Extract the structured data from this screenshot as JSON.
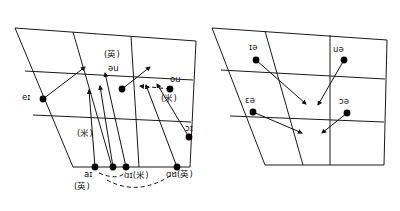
{
  "figure": {
    "type": "vowel-quadrilateral-diagram",
    "panel_count": 2,
    "stroke_color": "#1a1a1a",
    "dot_color": "#000000",
    "background": "#ffffff"
  },
  "panels": [
    {
      "id": "left-panel",
      "name": "closing-diphthongs-quadrilateral",
      "labels": [
        {
          "id": "l-ei",
          "text": "eɪ",
          "x": 22,
          "y": 93
        },
        {
          "id": "l-ying-top",
          "text": "(英)",
          "x": 104,
          "y": 54
        },
        {
          "id": "l-schwau",
          "text": "əu",
          "x": 108,
          "y": 69
        },
        {
          "id": "l-ou",
          "text": "ou",
          "x": 170,
          "y": 80
        },
        {
          "id": "l-mi-right",
          "text": "(米)",
          "x": 163,
          "y": 97
        },
        {
          "id": "l-mi-mid",
          "text": "(米)",
          "x": 79,
          "y": 132
        },
        {
          "id": "l-oi",
          "text": "ɔɪ",
          "x": 185,
          "y": 127
        },
        {
          "id": "l-ai-ying",
          "text": "aɪ",
          "x": 84,
          "y": 172
        },
        {
          "id": "l-ying-bot",
          "text": "(英)",
          "x": 76,
          "y": 185
        },
        {
          "id": "l-ai-mi",
          "text": "ɑɪ(米)",
          "x": 124,
          "y": 174
        },
        {
          "id": "l-au-ying",
          "text": "ɑu(英)",
          "x": 167,
          "y": 173
        }
      ],
      "dots": [
        {
          "id": "d-ei",
          "x": 43,
          "y": 99
        },
        {
          "id": "d-schwau",
          "x": 122,
          "y": 89
        },
        {
          "id": "d-ou",
          "x": 170,
          "y": 89
        },
        {
          "id": "d-oi",
          "x": 189,
          "y": 137
        },
        {
          "id": "d-ai1",
          "x": 95,
          "y": 167
        },
        {
          "id": "d-ai2",
          "x": 113,
          "y": 167
        },
        {
          "id": "d-ai3",
          "x": 126,
          "y": 167
        },
        {
          "id": "d-au",
          "x": 177,
          "y": 167
        }
      ]
    },
    {
      "id": "right-panel",
      "name": "centring-diphthongs-quadrilateral",
      "labels": [
        {
          "id": "r-ia",
          "text": "ɪə",
          "x": 249,
          "y": 46
        },
        {
          "id": "r-ua",
          "text": "uə",
          "x": 333,
          "y": 49
        },
        {
          "id": "r-ea",
          "text": "εə",
          "x": 246,
          "y": 99
        },
        {
          "id": "r-oa",
          "text": "ɔə",
          "x": 340,
          "y": 101
        }
      ],
      "dots": [
        {
          "id": "d-ia",
          "x": 256,
          "y": 60
        },
        {
          "id": "d-ua",
          "x": 344,
          "y": 60
        },
        {
          "id": "d-ea",
          "x": 253,
          "y": 112
        },
        {
          "id": "d-oa",
          "x": 347,
          "y": 113
        }
      ]
    }
  ]
}
